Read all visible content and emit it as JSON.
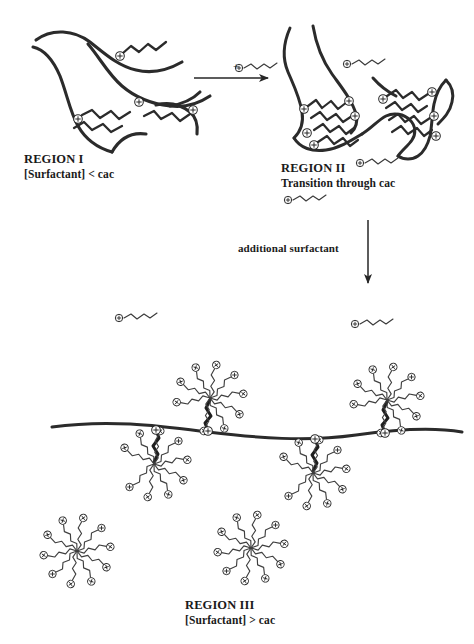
{
  "figure": {
    "type": "diagram",
    "background_color": "#ffffff",
    "ink_color": "#1a1a1a"
  },
  "regions": [
    {
      "id": "region-1",
      "title": "REGION I",
      "subtitle": "[Surfactant] < cac",
      "description": "Extended polymer chains with individually bound surfactant molecules"
    },
    {
      "id": "region-2",
      "title": "REGION II",
      "subtitle": "Transition through cac",
      "description": "Collapsed polymer coil with clustered surfactant tails"
    },
    {
      "id": "region-3",
      "title": "REGION III",
      "subtitle": "[Surfactant] > cac",
      "description": "Polymer backbone decorated with bound micelles plus free micelles in solution"
    }
  ],
  "arrows": {
    "horizontal": {
      "label": "+",
      "direction": "right",
      "reactant_icon": "surfactant-molecule"
    },
    "vertical": {
      "label": "additional surfactant",
      "direction": "down"
    }
  },
  "icons": {
    "charge_head": "plus-circle-icon",
    "surfactant": "surfactant-molecule-icon",
    "micelle": "micelle-icon",
    "polymer": "polymer-chain-icon"
  },
  "counts": {
    "region1_bound_surfactants": 4,
    "region2_bound_surfactants": 9,
    "region3_bound_micelles": 4,
    "region3_free_micelles": 2,
    "free_surfactants_midfield": 2,
    "micelle_tails_typical": 10
  }
}
